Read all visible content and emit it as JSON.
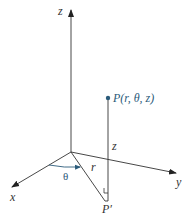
{
  "diagram": {
    "type": "cylindrical-coordinates",
    "axes": {
      "z_label": "z",
      "x_label": "x",
      "y_label": "y"
    },
    "point": {
      "label": "P(r, θ, z)"
    },
    "projection": {
      "label": "P′"
    },
    "segments": {
      "height_label": "z",
      "radius_label": "r",
      "angle_label": "θ"
    },
    "colors": {
      "axis": "#333333",
      "accent": "#2b5b7a"
    }
  }
}
